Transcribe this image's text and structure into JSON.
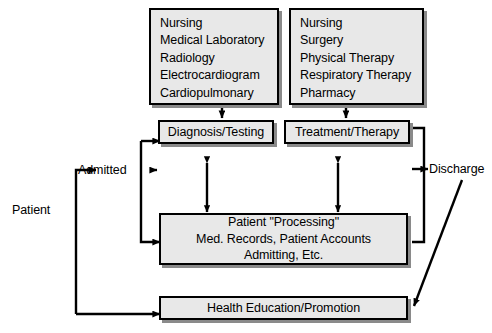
{
  "diagram": {
    "colors": {
      "box_fill": "#e8e8e8",
      "box_border": "#000000",
      "shadow": "#8a8a8a",
      "text": "#000000",
      "background": "#ffffff"
    },
    "service_boxes": [
      {
        "id": "diagnostic-services",
        "lines": [
          "Nursing",
          "Medical Laboratory",
          "Radiology",
          "Electrocardiogram",
          "Cardiopulmonary"
        ]
      },
      {
        "id": "therapeutic-services",
        "lines": [
          "Nursing",
          "Surgery",
          "Physical Therapy",
          "Respiratory Therapy",
          "Pharmacy"
        ]
      }
    ],
    "process_boxes": [
      {
        "id": "diagnosis-testing",
        "label": "Diagnosis/Testing"
      },
      {
        "id": "treatment-therapy",
        "label": "Treatment/Therapy"
      }
    ],
    "processing_box": {
      "id": "patient-processing",
      "lines": [
        "Patient \"Processing\"",
        "Med. Records, Patient Accounts",
        "Admitting, Etc."
      ]
    },
    "education_box": {
      "id": "health-education-promotion",
      "label": "Health Education/Promotion"
    },
    "flow_labels": [
      {
        "id": "patient",
        "text": "Patient"
      },
      {
        "id": "admitted",
        "text": "Admitted"
      },
      {
        "id": "discharge",
        "text": "Discharge"
      }
    ]
  }
}
